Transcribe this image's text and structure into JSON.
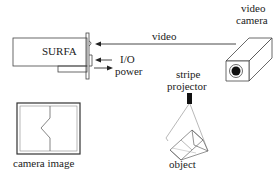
{
  "diagram": {
    "surfa_label": "SURFA",
    "video_label": "video",
    "io_label": "I/O",
    "power_label": "power",
    "camera_label_line1": "video",
    "camera_label_line2": "camera",
    "projector_label_line1": "stripe",
    "projector_label_line2": "projector",
    "object_label": "object",
    "camera_image_label": "camera image"
  },
  "colors": {
    "line": "#333333",
    "light_line": "#888888",
    "background": "#ffffff"
  }
}
